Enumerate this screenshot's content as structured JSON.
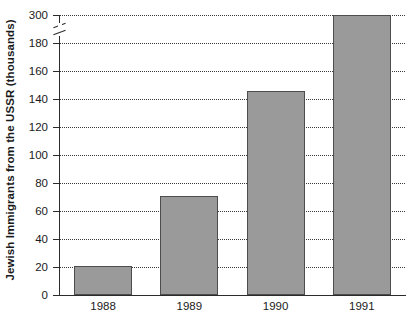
{
  "chart_data": {
    "type": "bar",
    "title": "",
    "xlabel": "",
    "ylabel": "Jewish Immigrants from the USSR (thousands)",
    "categories": [
      "1988",
      "1989",
      "1990",
      "1991"
    ],
    "values": [
      20.5,
      71,
      146,
      302
    ],
    "series": [
      {
        "name": "Jewish Immigrants from the USSR (thousands)",
        "values": [
          20.5,
          71,
          146,
          302
        ]
      }
    ],
    "ylim": [
      0,
      300
    ],
    "yticks": [
      0,
      20,
      40,
      60,
      80,
      100,
      120,
      140,
      160,
      180,
      300
    ],
    "ytick_labels": [
      "0",
      "20",
      "40",
      "60",
      "80",
      "100",
      "120",
      "140",
      "160",
      "180",
      "300"
    ],
    "axis_break": {
      "present": true,
      "between": [
        180,
        300
      ],
      "axis": "y"
    },
    "grid": true,
    "grid_style": "dotted",
    "grid_axis": "y",
    "legend": "none",
    "bar_color": "#9a9a9a",
    "bar_edge_color": "#4d4d4d",
    "background_color": "#ffffff",
    "axis_color": "#2b2b2b",
    "text_color": "#1a1a1a"
  }
}
